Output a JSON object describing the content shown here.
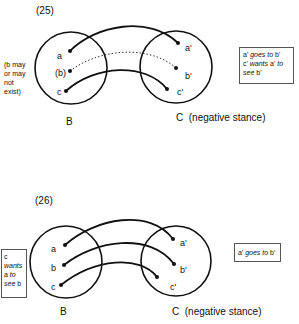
{
  "figures": [
    {
      "number": "(25)",
      "left_note": [
        "(b may",
        "or may",
        "not",
        "exist)"
      ],
      "circle_b_label": "B",
      "circle_c_label": "C  (negative stance)",
      "points_b": [
        "a",
        "(b)",
        "c"
      ],
      "points_c": [
        "a'",
        "b'",
        "c'"
      ],
      "box_lines": [
        {
          "parts": [
            {
              "t": "a' ",
              "i": false
            },
            {
              "t": "goes to",
              "i": true
            },
            {
              "t": " b'",
              "i": false
            }
          ]
        },
        {
          "parts": [
            {
              "t": "c' ",
              "i": false
            },
            {
              "t": "wants",
              "i": true
            },
            {
              "t": " a' ",
              "i": false
            },
            {
              "t": "to",
              "i": true
            }
          ]
        },
        {
          "parts": [
            {
              "t": "see",
              "i": true
            },
            {
              "t": " b'",
              "i": false
            }
          ]
        }
      ],
      "box_text": "a' goes to b' c' wants a' to see b'",
      "connections": [
        {
          "from": "a",
          "to": "a'",
          "style": "solid"
        },
        {
          "from": "(b)",
          "to": "b'",
          "style": "dotted"
        },
        {
          "from": "c",
          "to": "c'",
          "style": "solid"
        }
      ]
    },
    {
      "number": "(26)",
      "left_box_lines": [
        "c",
        "wants",
        "a to",
        "see b"
      ],
      "left_box_text": "c wants a to see b",
      "circle_b_label": "B",
      "circle_c_label": "C  (negative stance)",
      "points_b": [
        "a",
        "b",
        "c"
      ],
      "points_c": [
        "a'",
        "b'",
        "c'"
      ],
      "right_box_text": "a' goes to b'",
      "connections": [
        {
          "from": "a",
          "to": "a'",
          "style": "solid"
        },
        {
          "from": "b",
          "to": "b'",
          "style": "solid"
        },
        {
          "from": "c",
          "to": "c'",
          "style": "solid"
        }
      ]
    }
  ]
}
